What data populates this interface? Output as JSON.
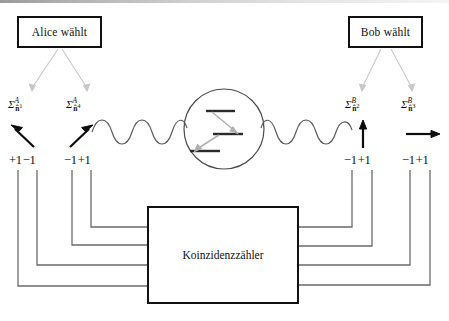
{
  "figure": {
    "kind": "epr-bell-test-setup",
    "language": "de"
  },
  "boxes": {
    "alice": {
      "label": "Alice wählt",
      "name": "alice-choice-box"
    },
    "bob": {
      "label": "Bob wählt",
      "name": "bob-choice-box"
    },
    "counter": {
      "label": "Koinzidenzzähler",
      "name": "coincidence-counter-box"
    }
  },
  "detectors": [
    {
      "id": "A1",
      "side": "left",
      "sigma": "Σ",
      "super": "A",
      "sub": "n̂",
      "sub_super": "1",
      "arrow": "diagonal-up-left",
      "outcomes": [
        "+1",
        "−1"
      ]
    },
    {
      "id": "A4",
      "side": "left",
      "sigma": "Σ",
      "super": "A",
      "sub": "n̂",
      "sub_super": "4",
      "arrow": "diagonal-up-right",
      "outcomes": [
        "−1",
        "+1"
      ]
    },
    {
      "id": "B2",
      "side": "right",
      "sigma": "Σ",
      "super": "B",
      "sub": "n̂",
      "sub_super": "2",
      "arrow": "up",
      "outcomes": [
        "−1",
        "+1"
      ]
    },
    {
      "id": "B3",
      "side": "right",
      "sigma": "Σ",
      "super": "B",
      "sub": "n̂",
      "sub_super": "3",
      "arrow": "right",
      "outcomes": [
        "−1",
        "+1"
      ]
    }
  ],
  "source": {
    "name": "atomic-cascade-source",
    "levels": 3,
    "transitions": 2
  },
  "photons": {
    "left": {
      "name": "photon-wave-left",
      "periods": 4
    },
    "right": {
      "name": "photon-wave-right",
      "periods": 4
    }
  },
  "colors": {
    "ink": "#111111",
    "wire": "#6b6b6b",
    "light_arrow": "#c8c8c8",
    "level_arrow": "#b0b0b0",
    "wave": "#5a5a5a",
    "scanline": "#9a9a9a"
  }
}
